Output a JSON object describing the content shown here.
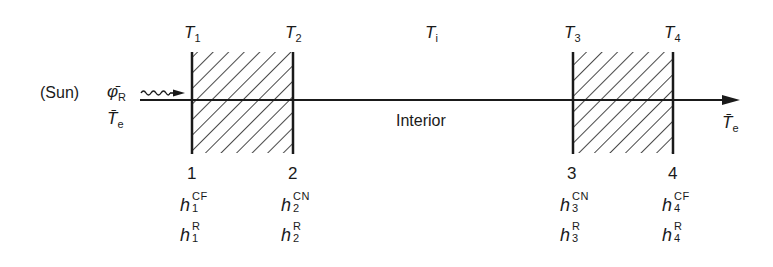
{
  "diagram": {
    "type": "wall-cross-section",
    "colors": {
      "ink": "#1a1a1a",
      "background": "#ffffff"
    },
    "source": {
      "sun_label": "(Sun)",
      "flux_symbol": "φ̄",
      "flux_subscript": "R",
      "ext_temp_left_symbol": "T̄",
      "ext_temp_left_subscript": "e"
    },
    "temperatures_top": [
      {
        "symbol": "T",
        "subscript": "1"
      },
      {
        "symbol": "T",
        "subscript": "2"
      },
      {
        "symbol": "T",
        "subscript": "i"
      },
      {
        "symbol": "T",
        "subscript": "3"
      },
      {
        "symbol": "T",
        "subscript": "4"
      }
    ],
    "interior_label": "Interior",
    "ext_temp_right": {
      "symbol": "T̄",
      "subscript": "e"
    },
    "surfaces": [
      {
        "number": "1",
        "hc_sup": "CF",
        "hc_sub": "1",
        "hr_sup": "R",
        "hr_sub": "1"
      },
      {
        "number": "2",
        "hc_sup": "CN",
        "hc_sub": "2",
        "hr_sup": "R",
        "hr_sub": "2"
      },
      {
        "number": "3",
        "hc_sup": "CN",
        "hc_sub": "3",
        "hr_sup": "R",
        "hr_sub": "3"
      },
      {
        "number": "4",
        "hc_sup": "CF",
        "hc_sub": "4",
        "hr_sup": "R",
        "hr_sub": "4"
      }
    ],
    "h_symbol": "h"
  }
}
